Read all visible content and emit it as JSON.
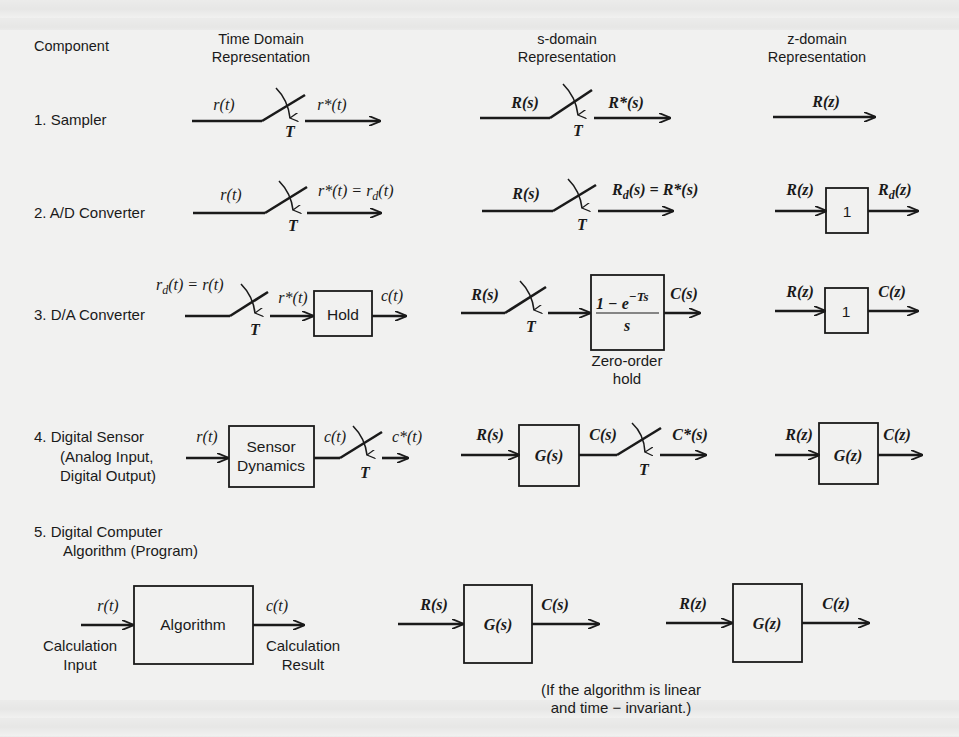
{
  "headers": {
    "component": "Component",
    "time_domain": [
      "Time Domain",
      "Representation"
    ],
    "s_domain": [
      "s-domain",
      "Representation"
    ],
    "z_domain": [
      "z-domain",
      "Representation"
    ]
  },
  "rows": [
    {
      "label": [
        "1.  Sampler"
      ],
      "time": {
        "in": "r(t)",
        "out": "r*(t)",
        "switch_period": "T"
      },
      "s": {
        "in": "R(s)",
        "out": "R*(s)",
        "switch_period": "T"
      },
      "z": {
        "signal": "R(z)"
      }
    },
    {
      "label": [
        "2.  A/D Converter"
      ],
      "time": {
        "in": "r(t)",
        "out": "r*(t) = r_d(t)",
        "out_parts": [
          "r*(t) = r",
          "d",
          "(t)"
        ],
        "switch_period": "T"
      },
      "s": {
        "in": "R(s)",
        "out": "R_d(s) = R*(s)",
        "out_parts": [
          "R",
          "d",
          "(s) = R*(s)"
        ],
        "switch_period": "T"
      },
      "z": {
        "in": "R(z)",
        "block": "1",
        "out": "R_d(z)",
        "out_parts": [
          "R",
          "d",
          "(z)"
        ]
      }
    },
    {
      "label": [
        "3.  D/A Converter"
      ],
      "time": {
        "in": "r_d(t) = r(t)",
        "in_parts": [
          "r",
          "d",
          "(t) = r(t)"
        ],
        "mid": "r*(t)",
        "block": "Hold",
        "out": "c(t)",
        "switch_period": "T"
      },
      "s": {
        "in": "R(s)",
        "block_num": "1 − e",
        "block_exp": "−Ts",
        "block_den": "s",
        "block": "(1 − e^−Ts)/s",
        "out": "C(s)",
        "switch_period": "T",
        "caption": [
          "Zero-order",
          "hold"
        ]
      },
      "z": {
        "in": "R(z)",
        "block": "1",
        "out": "C(z)"
      }
    },
    {
      "label": [
        "4.  Digital Sensor",
        "(Analog Input,",
        "Digital Output)"
      ],
      "time": {
        "in": "r(t)",
        "block": [
          "Sensor",
          "Dynamics"
        ],
        "mid": "c(t)",
        "out": "c*(t)",
        "switch_period": "T"
      },
      "s": {
        "in": "R(s)",
        "block": "G(s)",
        "mid": "C(s)",
        "out": "C*(s)",
        "switch_period": "T"
      },
      "z": {
        "in": "R(z)",
        "block": "G(z)",
        "out": "C(z)"
      }
    },
    {
      "label": [
        "5.  Digital Computer",
        "Algorithm (Program)"
      ],
      "time": {
        "in": "r(t)",
        "block": "Algorithm",
        "out": "c(t)",
        "in_caption": [
          "Calculation",
          "Input"
        ],
        "out_caption": [
          "Calculation",
          "Result"
        ]
      },
      "s": {
        "in": "R(s)",
        "block": "G(s)",
        "out": "C(s)"
      },
      "z": {
        "in": "R(z)",
        "block": "G(z)",
        "out": "C(z)"
      }
    }
  ],
  "footnote": [
    "(If the algorithm is linear",
    "and time − invariant.)"
  ]
}
